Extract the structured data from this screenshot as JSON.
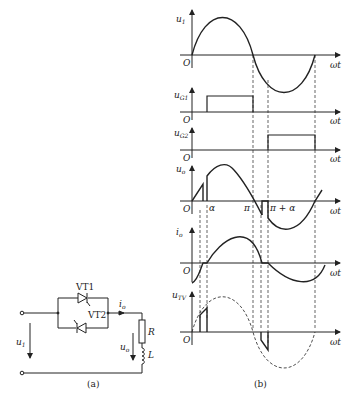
{
  "figure": {
    "part_a": {
      "caption": "(a)",
      "components": {
        "thyristor_1": "VT1",
        "thyristor_2": "VT2",
        "resistor": "R",
        "inductor": "L"
      },
      "labels": {
        "input_voltage": "u1",
        "output_current": "io",
        "output_voltage": "uo"
      }
    },
    "part_b": {
      "caption": "(b)",
      "x_axis_label": "ωt",
      "origin_label": "O",
      "markers": {
        "alpha": "α",
        "pi": "π",
        "pi_plus_alpha": "π + α"
      },
      "waveforms": [
        {
          "name": "u1",
          "description": "supply sine voltage"
        },
        {
          "name": "uG1",
          "description": "gate pulse VT1 from α to π"
        },
        {
          "name": "uG2",
          "description": "gate pulse VT2 from π+α to 2π"
        },
        {
          "name": "uo",
          "description": "output voltage"
        },
        {
          "name": "io",
          "description": "output current"
        },
        {
          "name": "uTV",
          "description": "thyristor voltage, dashed reference sine"
        }
      ]
    }
  }
}
